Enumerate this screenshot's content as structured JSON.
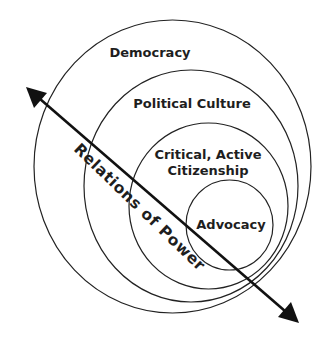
{
  "diagram": {
    "type": "nested-circles",
    "circles": [
      {
        "id": "democracy",
        "label": "Democracy",
        "cx": 172.5,
        "cy": 166.5,
        "rx": 138.5,
        "ry": 146.5
      },
      {
        "id": "political-culture",
        "label": "Political Culture",
        "cx": 191,
        "cy": 186,
        "rx": 107,
        "ry": 116
      },
      {
        "id": "critical-active-citizenship",
        "label_line1": "Critical, Active",
        "label_line2": "Citizenship",
        "cx": 208.5,
        "cy": 206,
        "rx": 79.5,
        "ry": 83
      },
      {
        "id": "advocacy",
        "label": "Advocacy",
        "cx": 229.5,
        "cy": 225,
        "rx": 43.5,
        "ry": 45
      }
    ],
    "axis": {
      "label": "Relations of Power",
      "direction": "bidirectional",
      "start": [
        26,
        87
      ],
      "end": [
        299,
        323
      ]
    },
    "colors": {
      "stroke": "#222222",
      "text": "#1e1e1e",
      "arrow": "#111111",
      "background": "#ffffff"
    }
  }
}
